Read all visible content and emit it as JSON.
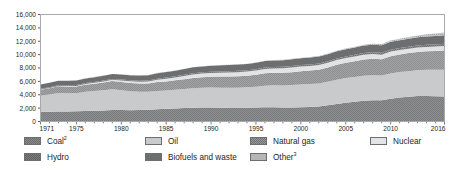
{
  "chart_data": {
    "type": "area",
    "stacked": true,
    "title": "",
    "subtitle": "",
    "xlabel": "",
    "ylabel": "",
    "ylim": [
      0,
      16000
    ],
    "xlim": [
      1971,
      2016
    ],
    "grid": false,
    "legend_position": "bottom",
    "y_ticks": [
      0,
      2000,
      4000,
      6000,
      8000,
      10000,
      12000,
      14000,
      16000
    ],
    "y_tick_labels": [
      "0",
      "2,000",
      "4,000",
      "6,000",
      "8,000",
      "10,000",
      "12,000",
      "14,000",
      "16,000"
    ],
    "x_ticks": [
      1971,
      1975,
      1980,
      1985,
      1990,
      1995,
      2000,
      2005,
      2010,
      2016
    ],
    "x_tick_labels": [
      "1971",
      "1975",
      "1980",
      "1985",
      "1990",
      "1995",
      "2000",
      "2005",
      "2010",
      "2016"
    ],
    "x": [
      1971,
      1972,
      1973,
      1974,
      1975,
      1976,
      1977,
      1978,
      1979,
      1980,
      1981,
      1982,
      1983,
      1984,
      1985,
      1986,
      1987,
      1988,
      1989,
      1990,
      1991,
      1992,
      1993,
      1994,
      1995,
      1996,
      1997,
      1998,
      1999,
      2000,
      2001,
      2002,
      2003,
      2004,
      2005,
      2006,
      2007,
      2008,
      2009,
      2010,
      2011,
      2012,
      2013,
      2014,
      2015,
      2016
    ],
    "series": [
      {
        "name": "Coal",
        "label": "Coal",
        "footnote": "2",
        "color": "#8d8e90",
        "pattern": "crosshatch",
        "values": [
          1440,
          1455,
          1500,
          1505,
          1520,
          1580,
          1620,
          1650,
          1720,
          1720,
          1700,
          1720,
          1760,
          1840,
          1920,
          1950,
          2010,
          2060,
          2080,
          2080,
          2060,
          2030,
          2030,
          2040,
          2080,
          2130,
          2140,
          2110,
          2090,
          2130,
          2180,
          2230,
          2430,
          2620,
          2800,
          2950,
          3090,
          3170,
          3180,
          3400,
          3600,
          3700,
          3800,
          3830,
          3780,
          3730
        ]
      },
      {
        "name": "Oil",
        "label": "Oil",
        "footnote": "",
        "color": "#c9cacc",
        "pattern": "solid",
        "values": [
          2420,
          2590,
          2770,
          2730,
          2690,
          2860,
          2930,
          3030,
          3100,
          2970,
          2840,
          2720,
          2670,
          2710,
          2700,
          2800,
          2850,
          2930,
          2960,
          3000,
          2990,
          3030,
          3030,
          3080,
          3130,
          3210,
          3290,
          3290,
          3360,
          3400,
          3410,
          3440,
          3510,
          3640,
          3690,
          3720,
          3760,
          3740,
          3680,
          3760,
          3790,
          3830,
          3870,
          3900,
          3960,
          4010
        ]
      },
      {
        "name": "Natural gas",
        "label": "Natural gas",
        "footnote": "",
        "color": "#9a9b9d",
        "pattern": "crosshatch",
        "values": [
          895,
          940,
          985,
          1000,
          1010,
          1065,
          1095,
          1140,
          1220,
          1230,
          1230,
          1240,
          1250,
          1340,
          1380,
          1400,
          1470,
          1530,
          1590,
          1630,
          1670,
          1680,
          1710,
          1720,
          1770,
          1860,
          1850,
          1890,
          1930,
          2000,
          2030,
          2080,
          2150,
          2210,
          2280,
          2330,
          2420,
          2470,
          2440,
          2590,
          2640,
          2700,
          2740,
          2760,
          2800,
          2870
        ]
      },
      {
        "name": "Nuclear",
        "label": "Nuclear",
        "footnote": "",
        "color": "#e2e3e4",
        "pattern": "solid",
        "values": [
          29,
          40,
          52,
          70,
          100,
          120,
          150,
          175,
          185,
          200,
          240,
          260,
          290,
          350,
          410,
          440,
          470,
          520,
          540,
          560,
          580,
          590,
          610,
          620,
          640,
          660,
          660,
          670,
          690,
          680,
          690,
          700,
          690,
          710,
          720,
          720,
          710,
          710,
          700,
          720,
          670,
          640,
          650,
          660,
          670,
          680
        ]
      },
      {
        "name": "Hydro",
        "label": "Hydro",
        "footnote": "",
        "color": "#7d7e80",
        "pattern": "crosshatch",
        "values": [
          104,
          108,
          110,
          118,
          123,
          124,
          128,
          134,
          139,
          145,
          148,
          150,
          158,
          163,
          167,
          172,
          175,
          180,
          180,
          184,
          188,
          188,
          196,
          196,
          203,
          208,
          210,
          214,
          218,
          223,
          220,
          221,
          222,
          231,
          235,
          244,
          250,
          255,
          262,
          275,
          282,
          291,
          300,
          310,
          318,
          330
        ]
      },
      {
        "name": "Biofuels and waste",
        "label": "Biofuels and waste",
        "footnote": "",
        "color": "#6d6e70",
        "pattern": "solid",
        "values": [
          640,
          650,
          660,
          670,
          685,
          695,
          710,
          725,
          740,
          755,
          770,
          785,
          800,
          815,
          830,
          845,
          860,
          875,
          885,
          900,
          915,
          925,
          940,
          950,
          965,
          980,
          990,
          1000,
          1015,
          1025,
          1035,
          1045,
          1060,
          1075,
          1090,
          1105,
          1120,
          1135,
          1150,
          1165,
          1180,
          1200,
          1220,
          1240,
          1260,
          1280
        ]
      },
      {
        "name": "Other",
        "label": "Other",
        "footnote": "3",
        "color": "#b5b6b8",
        "pattern": "dots",
        "values": [
          4,
          5,
          5,
          6,
          7,
          8,
          9,
          10,
          11,
          12,
          14,
          15,
          17,
          19,
          21,
          23,
          25,
          27,
          29,
          32,
          35,
          38,
          41,
          44,
          48,
          52,
          56,
          60,
          65,
          70,
          76,
          82,
          90,
          100,
          112,
          125,
          140,
          158,
          175,
          200,
          230,
          262,
          295,
          330,
          370,
          410
        ]
      }
    ],
    "totals_note": ""
  },
  "legend": {
    "rows": [
      [
        "Coal",
        "Oil",
        "Natural gas",
        "Nuclear"
      ],
      [
        "Hydro",
        "Biofuels and waste",
        "Other"
      ]
    ]
  }
}
